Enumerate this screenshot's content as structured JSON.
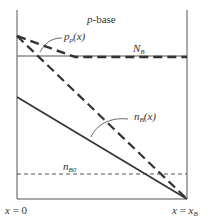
{
  "diagram": {
    "region_label": {
      "prefix": "p",
      "suffix": "-base"
    },
    "doping_level": {
      "main": "N",
      "sub": "B"
    },
    "hole_profile": {
      "main": "p",
      "sub": "p",
      "arg": "(x)"
    },
    "electron_profile": {
      "main": "n",
      "sub": "B",
      "arg": "(x)"
    },
    "equilibrium_electron": {
      "main": "n",
      "sub": "B0"
    },
    "x_left": {
      "lhs": "x",
      "eq": " = ",
      "rhs": "0"
    },
    "x_right": {
      "lhs": "x",
      "eq": " = ",
      "rhs_main": "x",
      "rhs_sub": "B"
    }
  },
  "colors": {
    "line": "#333333",
    "axis": "#555555"
  }
}
